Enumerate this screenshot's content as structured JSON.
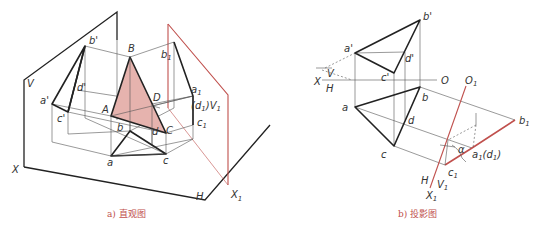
{
  "figure_a": {
    "caption": "a) 直观图",
    "labels": {
      "V": "V",
      "X": "X",
      "H": "H",
      "X1": "X",
      "X1_sub": "1",
      "V1": "V",
      "V1_sub": "1",
      "A": "A",
      "B": "B",
      "C": "C",
      "D": "D",
      "a": "a",
      "b": "b",
      "c": "c",
      "d": "d",
      "a_prime": "a'",
      "b_prime": "b'",
      "c_prime": "c'",
      "d_prime": "d'",
      "a1_prime": "a",
      "b1_prime": "b",
      "c1_prime": "c",
      "d1_prime": "(d",
      "d1_close": ")",
      "sub1": "1",
      "primemark": "'"
    },
    "fill_color": "#e6b3ae"
  },
  "figure_b": {
    "caption": "b) 投影图",
    "labels": {
      "X": "X",
      "V": "V",
      "H": "H",
      "O": "O",
      "O1": "O",
      "O1_sub": "1",
      "a": "a",
      "b": "b",
      "c": "c",
      "d": "d",
      "a_prime": "a'",
      "b_prime": "b'",
      "c_prime": "c'",
      "d_prime": "d'",
      "b1_prime": "b",
      "c1_prime": "c",
      "a1d1": "a",
      "a1d1_rest": "(d",
      "close": ")",
      "alpha": "α",
      "H2": "H",
      "V1": "V",
      "X1": "X",
      "sub1": "1",
      "primemark": "'"
    },
    "accent_color": "#c0504d"
  }
}
